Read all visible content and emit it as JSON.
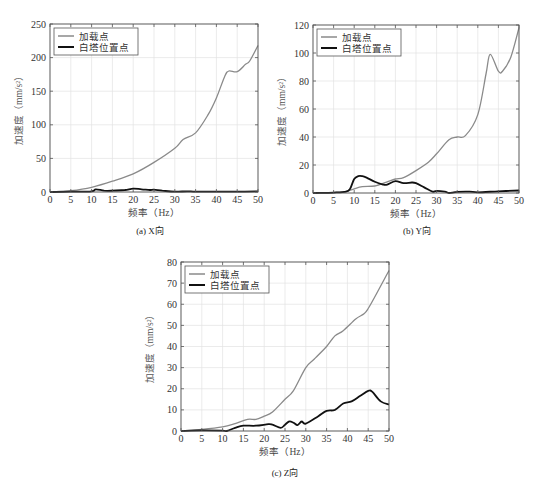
{
  "figure": {
    "captions": [
      "(a) X向",
      "(b) Y向",
      "(c) Z向"
    ],
    "legend": [
      "加载点",
      "白塔位置点"
    ],
    "colors": {
      "load_point": "#8a8a8a",
      "tower_point": "#111111",
      "grid": "#e2e2e2",
      "axis": "#555555"
    }
  },
  "chart_data": [
    {
      "type": "line",
      "title": "(a) X向",
      "xlabel": "频率（Hz）",
      "ylabel": "加速度（mm/s²）",
      "xlim": [
        0,
        50
      ],
      "ylim": [
        0,
        250
      ],
      "xticks": [
        0,
        5,
        10,
        15,
        20,
        25,
        30,
        35,
        40,
        45,
        50
      ],
      "yticks": [
        0,
        50,
        100,
        150,
        200,
        250
      ],
      "grid": true,
      "legend_position": "upper left",
      "series": [
        {
          "name": "加载点",
          "color": "#8a8a8a",
          "x": [
            0,
            5,
            10,
            15,
            20,
            25,
            30,
            32,
            35,
            38,
            40,
            42,
            43,
            45,
            47,
            48,
            50
          ],
          "y": [
            0,
            2,
            7,
            16,
            27,
            44,
            65,
            78,
            88,
            115,
            140,
            172,
            180,
            179,
            190,
            195,
            218
          ]
        },
        {
          "name": "白塔位置点",
          "color": "#111111",
          "x": [
            0,
            5,
            10,
            11,
            13,
            15,
            18,
            20,
            22,
            24,
            25,
            27,
            30,
            33,
            35,
            40,
            45,
            50
          ],
          "y": [
            0,
            0.5,
            1,
            4,
            2,
            2,
            3,
            5,
            4,
            3,
            3.5,
            2,
            0.5,
            1,
            0.5,
            0.5,
            0.5,
            1
          ]
        }
      ]
    },
    {
      "type": "line",
      "title": "(b) Y向",
      "xlabel": "频率（Hz）",
      "ylabel": "加速度（mm/s²）",
      "xlim": [
        0,
        50
      ],
      "ylim": [
        0,
        120
      ],
      "xticks": [
        0,
        5,
        10,
        15,
        20,
        25,
        30,
        35,
        40,
        45,
        50
      ],
      "yticks": [
        0,
        20,
        40,
        60,
        80,
        100,
        120
      ],
      "grid": true,
      "legend_position": "upper left",
      "series": [
        {
          "name": "加载点",
          "color": "#8a8a8a",
          "x": [
            0,
            5,
            8,
            10,
            12,
            15,
            18,
            20,
            22,
            25,
            28,
            30,
            33,
            35,
            37,
            40,
            42,
            43,
            45,
            46,
            48,
            50
          ],
          "y": [
            0,
            0.3,
            1,
            3,
            4.5,
            5,
            8,
            10,
            11,
            16,
            22,
            28,
            38,
            40,
            41,
            56,
            85,
            99,
            87,
            87,
            97,
            118
          ]
        },
        {
          "name": "白塔位置点",
          "color": "#111111",
          "x": [
            0,
            5,
            8,
            9,
            10,
            11,
            12,
            13,
            15,
            17,
            18,
            20,
            22,
            24,
            25,
            27,
            29,
            30,
            32,
            33,
            35,
            38,
            40,
            45,
            50
          ],
          "y": [
            0,
            0.3,
            1,
            3,
            10,
            12,
            12,
            11,
            8,
            6,
            6,
            8.5,
            7,
            7.5,
            7,
            4,
            1,
            1.5,
            1,
            0,
            0.8,
            1,
            0.5,
            1.2,
            1.8
          ]
        }
      ]
    },
    {
      "type": "line",
      "title": "(c) Z向",
      "xlabel": "频率（Hz）",
      "ylabel": "加速度（mm/s²）",
      "xlim": [
        0,
        50
      ],
      "ylim": [
        0,
        80
      ],
      "xticks": [
        0,
        5,
        10,
        15,
        20,
        25,
        30,
        35,
        40,
        45,
        50
      ],
      "yticks": [
        0,
        10,
        20,
        30,
        40,
        50,
        60,
        70,
        80
      ],
      "grid": true,
      "legend_position": "upper left",
      "series": [
        {
          "name": "加载点",
          "color": "#8a8a8a",
          "x": [
            0,
            5,
            10,
            13,
            16,
            18,
            20,
            22,
            25,
            27,
            30,
            32,
            35,
            37,
            39,
            42,
            44,
            45,
            47,
            50
          ],
          "y": [
            0,
            0.8,
            2,
            3.5,
            5.5,
            5.5,
            7,
            9,
            15,
            19,
            30,
            34,
            40,
            45,
            47.5,
            53,
            55.5,
            58,
            65,
            76
          ]
        },
        {
          "name": "白塔位置点",
          "color": "#111111",
          "x": [
            0,
            5,
            10,
            11,
            13,
            15,
            18,
            21,
            22,
            24,
            25,
            26,
            27,
            28,
            29,
            30,
            33,
            35,
            37,
            39,
            41,
            43,
            45,
            46,
            48,
            50
          ],
          "y": [
            0,
            0.3,
            0.2,
            0,
            1.5,
            2.5,
            2.5,
            3.2,
            3,
            1.5,
            3,
            4.5,
            4,
            2.8,
            4.5,
            3.5,
            7,
            9.5,
            10,
            13,
            14,
            16.5,
            19,
            18.5,
            14,
            12.5
          ]
        }
      ]
    }
  ]
}
